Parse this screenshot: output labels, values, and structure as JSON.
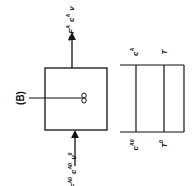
{
  "diagram": {
    "panel_label": "(B)",
    "reactor": {
      "outlet_labels": [
        "T",
        "F",
        "A",
        "c",
        "A",
        "v"
      ],
      "outlet": {
        "T": "T",
        "F": "F",
        "F_sub": "A",
        "c": "c",
        "c_sub": "A",
        "v": "v"
      },
      "inlet": {
        "T": "T",
        "T_sub": "0",
        "F": "F",
        "F_sub": "A0",
        "c": "c",
        "c_sub": "A0",
        "v": "v",
        "v_sub": "0"
      }
    },
    "profile": {
      "top": {
        "c": "c",
        "c_sub": "A",
        "T": "T"
      },
      "bottom": {
        "c": "c",
        "c_sub": "A0",
        "T": "T",
        "T_sub": "0"
      }
    }
  }
}
